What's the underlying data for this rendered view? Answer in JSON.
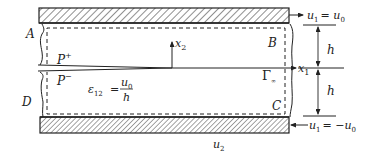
{
  "diagram": {
    "colors": {
      "line": "#222222",
      "hatch": "#333333",
      "background": "#ffffff"
    },
    "corner_labels": {
      "A": "A",
      "B": "B",
      "C": "C",
      "D": "D"
    },
    "crack_faces": {
      "upper": "P",
      "upper_sup": "+",
      "lower": "P",
      "lower_sup": "−"
    },
    "axes": {
      "x1": "x",
      "x1_sub": "1",
      "x2": "x",
      "x2_sub": "2"
    },
    "contour": {
      "label": "Γ",
      "sub": "∞"
    },
    "strain": {
      "lhs": "ε",
      "lhs_sub": "12",
      "eq": "=",
      "numerator": "u",
      "numerator_sub": "0",
      "denominator": "h"
    },
    "boundary_conditions": {
      "top": {
        "u": "u",
        "u_sub": "1",
        "rhs": "= u",
        "rhs_sub": "0"
      },
      "bottom": {
        "u": "u",
        "u_sub": "1",
        "rhs": "= −u",
        "rhs_sub": "0"
      }
    },
    "dimensions": {
      "upper_h": "h",
      "lower_h": "h"
    },
    "bottom_label": {
      "u": "u",
      "sub": "2"
    }
  }
}
